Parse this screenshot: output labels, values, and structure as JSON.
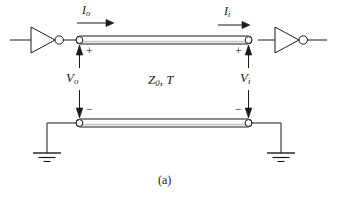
{
  "figure": {
    "caption": "(a)",
    "stroke_color": "#1a1a1a",
    "fill_color": "#ffffff",
    "background": "#ffffff"
  },
  "labels": {
    "current_out": {
      "symbol": "I",
      "sub": "o",
      "text": "Io"
    },
    "current_in": {
      "symbol": "I",
      "sub": "i",
      "text": "Ii"
    },
    "voltage_out": {
      "symbol": "V",
      "sub": "o",
      "text": "Vo"
    },
    "voltage_in": {
      "symbol": "V",
      "sub": "i",
      "text": "Vi"
    },
    "line_params": {
      "symbol": "Z",
      "sub": "0",
      "sep": ", ",
      "symbol2": "T",
      "text": "Z0, T"
    }
  },
  "polarity": {
    "plus_left": "+",
    "minus_left": "−",
    "plus_right": "+",
    "minus_right": "−"
  },
  "components": [
    {
      "name": "inverter-left",
      "type": "inverter",
      "orientation": "right"
    },
    {
      "name": "inverter-right",
      "type": "inverter",
      "orientation": "right"
    },
    {
      "name": "transmission-line-top",
      "type": "transmission-line"
    },
    {
      "name": "transmission-line-bottom",
      "type": "transmission-line"
    },
    {
      "name": "ground-left",
      "type": "ground"
    },
    {
      "name": "ground-right",
      "type": "ground"
    },
    {
      "name": "terminal-top-left",
      "type": "node"
    },
    {
      "name": "terminal-top-right",
      "type": "node"
    },
    {
      "name": "terminal-bottom-left",
      "type": "node"
    },
    {
      "name": "terminal-bottom-right",
      "type": "node"
    }
  ]
}
